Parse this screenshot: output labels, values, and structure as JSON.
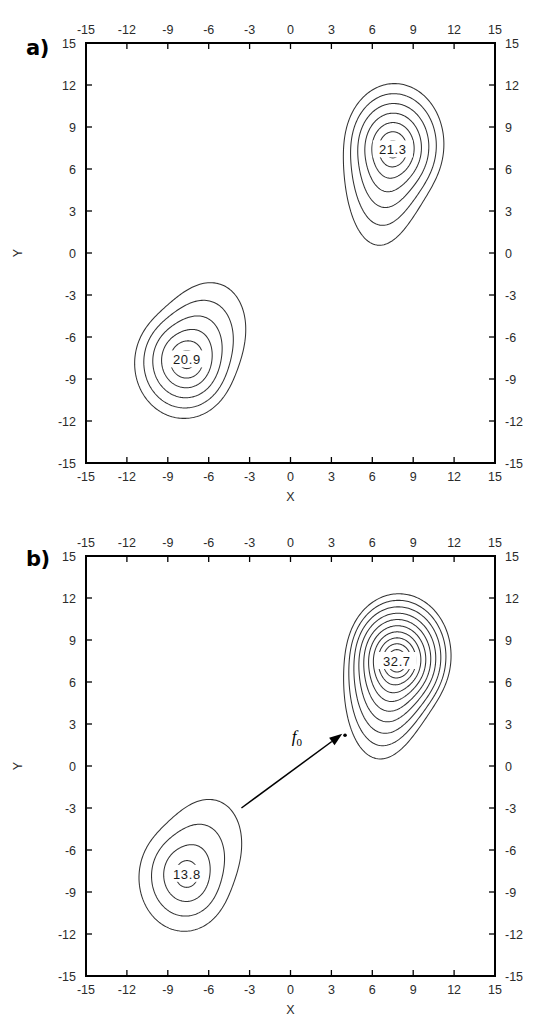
{
  "figure": {
    "width": 560,
    "height": 1026,
    "background": "#ffffff",
    "ink_color": "#333333"
  },
  "panels": [
    {
      "tag": "a)",
      "name": "panel-a",
      "chart_ref": 0
    },
    {
      "tag": "b)",
      "name": "panel-b",
      "chart_ref": 1
    }
  ],
  "chart_data": [
    {
      "type": "contour",
      "panel": "a)",
      "title": "",
      "xlabel": "X",
      "ylabel": "Y",
      "xlim": [
        -15,
        15
      ],
      "ylim": [
        -15,
        15
      ],
      "xticks": [
        -15,
        -12,
        -9,
        -6,
        -3,
        0,
        3,
        6,
        9,
        12,
        15
      ],
      "yticks": [
        -15,
        -12,
        -9,
        -6,
        -3,
        0,
        3,
        6,
        9,
        12,
        15
      ],
      "xtick_labels": [
        "-15",
        "-12",
        "-9",
        "-6",
        "-3",
        "0",
        "3",
        "6",
        "9",
        "12",
        "15"
      ],
      "ytick_labels": [
        "-15",
        "-12",
        "-9",
        "-6",
        "-3",
        "0",
        "3",
        "6",
        "9",
        "12",
        "15"
      ],
      "ticks_all_sides": true,
      "grid": false,
      "legend": "none",
      "peaks": [
        {
          "label": "21.3",
          "center": [
            7.5,
            7.4
          ],
          "n_contours": 7,
          "max_value": 21.3,
          "tail_direction": "down-left",
          "outer_rx": 3.6,
          "outer_ry": 4.3,
          "tail_length": 5.6,
          "tail_angle_deg": 248
        },
        {
          "label": "20.9",
          "center": [
            -7.6,
            -7.6
          ],
          "n_contours": 6,
          "max_value": 20.9,
          "tail_direction": "up-right",
          "outer_rx": 3.6,
          "outer_ry": 3.9,
          "tail_length": 5.4,
          "tail_angle_deg": 52
        }
      ],
      "annotations": []
    },
    {
      "type": "contour",
      "panel": "b)",
      "title": "",
      "xlabel": "X",
      "ylabel": "Y",
      "xlim": [
        -15,
        15
      ],
      "ylim": [
        -15,
        15
      ],
      "xticks": [
        -15,
        -12,
        -9,
        -6,
        -3,
        0,
        3,
        6,
        9,
        12,
        15
      ],
      "yticks": [
        -15,
        -12,
        -9,
        -6,
        -3,
        0,
        3,
        6,
        9,
        12,
        15
      ],
      "xtick_labels": [
        "-15",
        "-12",
        "-9",
        "-6",
        "-3",
        "0",
        "3",
        "6",
        "9",
        "12",
        "15"
      ],
      "ytick_labels": [
        "-15",
        "-12",
        "-9",
        "-6",
        "-3",
        "0",
        "3",
        "6",
        "9",
        "12",
        "15"
      ],
      "ticks_all_sides": true,
      "grid": false,
      "legend": "none",
      "peaks": [
        {
          "label": "32.7",
          "center": [
            7.8,
            7.5
          ],
          "n_contours": 11,
          "max_value": 32.7,
          "tail_direction": "down-left",
          "outer_rx": 3.8,
          "outer_ry": 4.4,
          "tail_length": 6.0,
          "tail_angle_deg": 245
        },
        {
          "label": "13.8",
          "center": [
            -7.6,
            -7.7
          ],
          "n_contours": 4,
          "max_value": 13.8,
          "tail_direction": "up-right",
          "outer_rx": 3.3,
          "outer_ry": 3.8,
          "tail_length": 5.2,
          "tail_angle_deg": 52
        }
      ],
      "annotations": [
        {
          "kind": "arrow",
          "label": "f",
          "label_sub": "0",
          "from": [
            -3.6,
            -3.0
          ],
          "to": [
            3.8,
            2.3
          ],
          "label_pos": [
            0.1,
            1.7
          ]
        },
        {
          "kind": "dot",
          "at": [
            4.0,
            2.2
          ]
        }
      ]
    }
  ]
}
